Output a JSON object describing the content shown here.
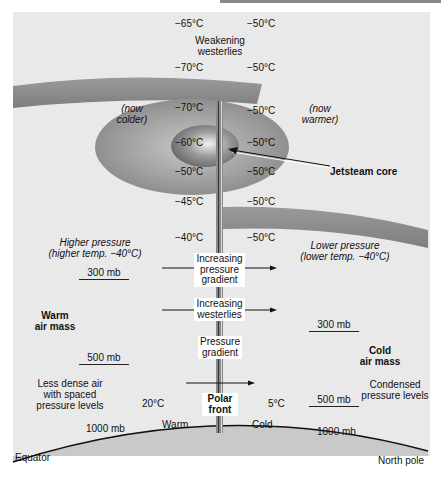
{
  "diagram": {
    "colors": {
      "background": "#e9e9e9",
      "band": "#8a8a8a",
      "ellipse_outer": "#999999",
      "ellipse_inner": "#7c7c7c",
      "ground": "#c9c9c9",
      "pole": "#7a7a7a"
    },
    "temperatures_left": [
      "−65°C",
      "−70°C",
      "−70°C",
      "−60°C",
      "−50°C",
      "−45°C",
      "−40°C"
    ],
    "temperatures_right": [
      "−50°C",
      "−50°C",
      "−50°C",
      "−50°C",
      "−50°C",
      "−50°C",
      "−50°C"
    ],
    "top_label": [
      "Weakening",
      "westerlies"
    ],
    "now_colder": [
      "(now",
      "colder)"
    ],
    "now_warmer": [
      "(now",
      "warmer)"
    ],
    "jet_core": "Jetsteam core",
    "higher_pressure": [
      "Higher pressure",
      "(higher temp. −40°C)"
    ],
    "lower_pressure": [
      "Lower pressure",
      "(lower  temp. −40°C)"
    ],
    "center_labels": {
      "increasing_gradient": [
        "Increasing",
        "pressure",
        "gradient"
      ],
      "increasing_westerlies": [
        "Increasing",
        "westerlies"
      ],
      "pressure_gradient": [
        "Pressure",
        "gradient"
      ],
      "polar_front": [
        "Polar",
        "front"
      ]
    },
    "warm_air_mass": [
      "Warm",
      "air mass"
    ],
    "cold_air_mass": [
      "Cold",
      "air mass"
    ],
    "pressure_levels": {
      "left_300": "300 mb",
      "left_500": "500 mb",
      "right_300": "300 mb",
      "right_500": "500 mb",
      "left_1000": "1000 mb",
      "right_1000": "1000 mb"
    },
    "less_dense": [
      "Less dense air",
      "with spaced",
      "pressure levels"
    ],
    "condensed": [
      "Condensed",
      "pressure levels"
    ],
    "surface_temps": {
      "left": "20°C",
      "right": "5°C"
    },
    "surface_labels": {
      "warm": "Warm",
      "cold": "Cold"
    },
    "ends": {
      "left": "Equator",
      "right": "North pole"
    }
  }
}
